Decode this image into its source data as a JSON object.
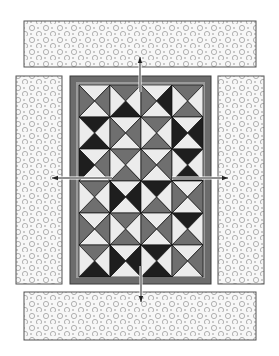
{
  "diagram": {
    "type": "quilt-assembly",
    "colors": {
      "W": "#ececec",
      "G": "#6f6f6f",
      "D": "#1e1e1e",
      "frame_outer": "#3a3a3a",
      "frame_band": "#6c6c6c",
      "frame_inner": "#9a9a9a",
      "border_fill": "#f7f7f7",
      "border_stroke": "#555555",
      "dot_ring": "#a8a8a8",
      "dot_center": "#7a7a7a",
      "arrow": "#222222"
    },
    "center": {
      "frame": {
        "x": 70,
        "y": 76,
        "w": 141,
        "h": 208
      },
      "band": 8,
      "grid": {
        "x": 79,
        "y": 85,
        "cols": 4,
        "rows": 6,
        "cell_w": 31,
        "cell_h": 32
      },
      "blocks_TRBL": [
        [
          "WGWG",
          "GWDW",
          "WDWG",
          "GWGW"
        ],
        [
          "DWDW",
          "WGWG",
          "GWGW",
          "WDWD"
        ],
        [
          "WGWD",
          "GWGW",
          "WGWG",
          "DWDW"
        ],
        [
          "GWGW",
          "WDWD",
          "DWGW",
          "WGWG"
        ],
        [
          "WGWG",
          "GWGW",
          "WGWG",
          "DWGW"
        ],
        [
          "GWDW",
          "WDWD",
          "DWDW",
          "WGWG"
        ]
      ]
    },
    "borders": [
      {
        "name": "top-border-strip",
        "x": 24,
        "y": 21,
        "w": 232,
        "h": 46
      },
      {
        "name": "bottom-border-strip",
        "x": 24,
        "y": 292,
        "w": 232,
        "h": 48
      },
      {
        "name": "left-border-strip",
        "x": 16,
        "y": 76,
        "w": 46,
        "h": 208
      },
      {
        "name": "right-border-strip",
        "x": 218,
        "y": 76,
        "w": 46,
        "h": 208
      }
    ],
    "arrows": [
      {
        "name": "arrow-up",
        "x1": 140,
        "y1": 92,
        "x2": 140,
        "y2": 57
      },
      {
        "name": "arrow-down",
        "x1": 141,
        "y1": 266,
        "x2": 141,
        "y2": 302
      },
      {
        "name": "arrow-left",
        "x1": 112,
        "y1": 178,
        "x2": 52,
        "y2": 178
      },
      {
        "name": "arrow-right",
        "x1": 172,
        "y1": 178,
        "x2": 228,
        "y2": 178
      }
    ]
  }
}
